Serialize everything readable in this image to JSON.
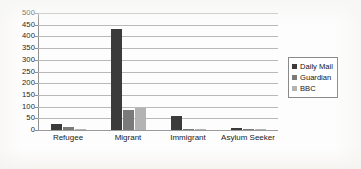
{
  "chart_data": {
    "type": "bar",
    "title": "",
    "subtitle": "",
    "xlabel": "",
    "ylabel": "",
    "categories": [
      "Refugee",
      "Migrant",
      "Immigrant",
      "Asylum Seeker"
    ],
    "series": [
      {
        "name": "Daily Mail",
        "color": "#3b3b3b",
        "values": [
          25,
          430,
          60,
          10
        ]
      },
      {
        "name": "Guardian",
        "color": "#7a7a7a",
        "values": [
          15,
          85,
          3,
          5
        ]
      },
      {
        "name": "BBC",
        "color": "#b3b3b3",
        "values": [
          2,
          92,
          2,
          3
        ]
      }
    ],
    "ylim": [
      0,
      500
    ],
    "ytick_step": 50,
    "yticks": [
      500,
      450,
      400,
      350,
      300,
      250,
      200,
      150,
      100,
      50,
      0
    ],
    "grid": true,
    "grid_axis": "y",
    "legend_position": "right",
    "legend_border": true,
    "plot_background": "#ffffff",
    "gridline_color": "#b9b9b9",
    "axis_color": "#8f8f8f"
  }
}
